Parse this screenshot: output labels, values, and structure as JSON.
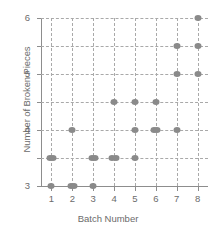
{
  "chart_data": {
    "type": "scatter",
    "title": "",
    "xlabel": "Batch Number",
    "ylabel": "Number of Broken Pieces",
    "xlim": [
      0.5,
      8.5
    ],
    "ylim": [
      0,
      6
    ],
    "xticks": [
      "1",
      "2",
      "3",
      "4",
      "5",
      "6",
      "7",
      "8"
    ],
    "yticks": [
      "0",
      "1",
      "2",
      "3",
      "4",
      "5",
      "6"
    ],
    "grid": "dashed-both",
    "legend": "none",
    "marker_color": "#8a8a8a",
    "axis_color": "#8d8d8d",
    "grid_color": "#a9a9a9",
    "points": [
      {
        "x": 1,
        "y": 0,
        "count": 1
      },
      {
        "x": 1,
        "y": 1,
        "count": 2
      },
      {
        "x": 2,
        "y": 0,
        "count": 2
      },
      {
        "x": 2,
        "y": 2,
        "count": 1
      },
      {
        "x": 3,
        "y": 0,
        "count": 1
      },
      {
        "x": 3,
        "y": 1,
        "count": 2
      },
      {
        "x": 4,
        "y": 1,
        "count": 2
      },
      {
        "x": 4,
        "y": 3,
        "count": 1
      },
      {
        "x": 5,
        "y": 1,
        "count": 1
      },
      {
        "x": 5,
        "y": 2,
        "count": 1
      },
      {
        "x": 5,
        "y": 3,
        "count": 1
      },
      {
        "x": 6,
        "y": 2,
        "count": 2
      },
      {
        "x": 6,
        "y": 3,
        "count": 1
      },
      {
        "x": 7,
        "y": 2,
        "count": 1
      },
      {
        "x": 7,
        "y": 4,
        "count": 1
      },
      {
        "x": 7,
        "y": 5,
        "count": 1
      },
      {
        "x": 8,
        "y": 4,
        "count": 1
      },
      {
        "x": 8,
        "y": 5,
        "count": 1
      },
      {
        "x": 8,
        "y": 6,
        "count": 1
      }
    ]
  }
}
